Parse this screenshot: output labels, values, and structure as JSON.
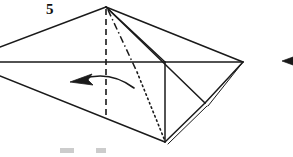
{
  "figure": {
    "kind": "origami-fold-diagram",
    "step_label": "5",
    "background_color": "#ffffff",
    "ink_color": "#1a1a1a",
    "caption_partial": "",
    "width": 293,
    "height": 157
  },
  "geometry": {
    "apex": [
      106,
      7
    ],
    "right_vertex": [
      243,
      62
    ],
    "center_vertex": [
      165,
      62
    ],
    "bottom_vertex": [
      165,
      142
    ],
    "fold_corner": [
      205,
      103
    ],
    "left_upper_exit": [
      0,
      47
    ],
    "left_mid_exit": [
      0,
      62
    ],
    "left_lower_exit": [
      0,
      76
    ],
    "dashed_line_end": [
      106,
      118
    ],
    "horizontal_baseline_y": 62
  },
  "lines": {
    "solid_label": "cut or edge line",
    "dashed_label": "valley fold line",
    "dotted_label": "hidden edge line",
    "dashdot_label": "mountain fold line"
  },
  "arrows": {
    "fold_arrow_label": "fold-left-arrow",
    "fold_arrow_direction": "left",
    "edge_arrow_label": "partial-arrowhead-right-edge"
  },
  "colors": {
    "ink": "#1a1a1a",
    "paper": "#ffffff",
    "light_ink": "#3a3a3a"
  }
}
